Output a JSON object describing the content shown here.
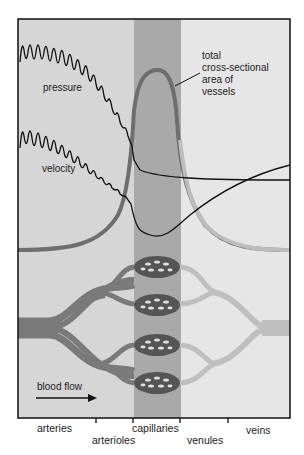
{
  "labels": {
    "pressure": "pressure",
    "velocity": "velocity",
    "area_line1": "total",
    "area_line2": "cross-sectional",
    "area_line3": "area of",
    "area_line4": "vessels",
    "blood_flow": "blood flow"
  },
  "axis": {
    "categories": [
      "arteries",
      "arterioles",
      "capillaries",
      "venules",
      "veins"
    ]
  },
  "colors": {
    "frame": "#111111",
    "band_left": "#d6d6d6",
    "band_capillary": "#a9a9a9",
    "band_right": "#e6e6e6",
    "area_curve_left": "#6e6e6e",
    "area_curve_right": "#bdbdbd",
    "vessel_arterial": "#7a7a7a",
    "vessel_venous": "#bfbfbf",
    "capillary_bed": "#555555"
  }
}
